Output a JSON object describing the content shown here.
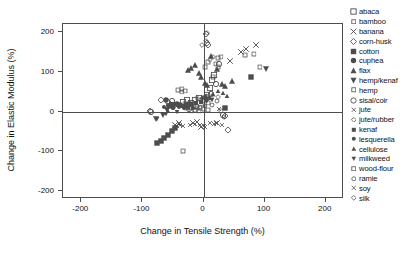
{
  "chart_data": {
    "type": "scatter",
    "title": "",
    "xlabel": "Change in Tensile Strength (%)",
    "ylabel": "Change in Elastic Modulus (%)",
    "xlim": [
      -230,
      230
    ],
    "ylim": [
      -220,
      220
    ],
    "xticks": [
      -200,
      -100,
      0,
      100,
      200
    ],
    "xticklabels": [
      "-200",
      "-100",
      "0",
      "100",
      "200"
    ],
    "yticks": [
      200,
      100,
      0,
      -100,
      -200
    ],
    "yticklabels": [
      "200",
      "100",
      "0",
      "-100",
      "-200"
    ],
    "grid": false,
    "reference_lines": {
      "x": 0,
      "y": 0
    },
    "legend_position": "right-outside",
    "series": [
      {
        "name": "abaca",
        "marker": "open-square",
        "points": [
          [
            -34,
            24
          ],
          [
            -27,
            30
          ],
          [
            -20,
            22
          ],
          [
            -14,
            28
          ],
          [
            -8,
            34
          ],
          [
            6,
            42
          ],
          [
            10,
            60
          ],
          [
            14,
            78
          ],
          [
            18,
            92
          ]
        ]
      },
      {
        "name": "bamboo",
        "marker": "open-square-small",
        "points": [
          [
            -42,
            54
          ],
          [
            -36,
            50
          ],
          [
            -30,
            20
          ],
          [
            -24,
            18
          ],
          [
            3,
            112
          ],
          [
            8,
            124
          ],
          [
            20,
            120
          ],
          [
            24,
            134
          ]
        ]
      },
      {
        "name": "banana",
        "marker": "cross-x",
        "points": [
          [
            -46,
            -34
          ],
          [
            -40,
            -30
          ],
          [
            -18,
            -28
          ],
          [
            -10,
            -26
          ],
          [
            -4,
            -38
          ],
          [
            22,
            -30
          ],
          [
            44,
            128
          ],
          [
            62,
            150
          ],
          [
            70,
            158
          ],
          [
            86,
            168
          ]
        ]
      },
      {
        "name": "corn-husk",
        "marker": "open-diamond",
        "points": [
          [
            -88,
            2
          ],
          [
            -70,
            28
          ],
          [
            -58,
            24
          ],
          [
            4,
            196
          ],
          [
            6,
            172
          ],
          [
            8,
            166
          ],
          [
            36,
            -12
          ],
          [
            40,
            -46
          ]
        ]
      },
      {
        "name": "cotton",
        "marker": "filled-square",
        "points": [
          [
            -76,
            -80
          ],
          [
            -70,
            -74
          ],
          [
            -64,
            -66
          ],
          [
            -58,
            -58
          ],
          [
            -52,
            -48
          ],
          [
            -46,
            -42
          ],
          [
            36,
            10
          ],
          [
            78,
            88
          ]
        ]
      },
      {
        "name": "cuphea",
        "marker": "filled-circle",
        "points": [
          [
            -62,
            30
          ],
          [
            -56,
            14
          ],
          [
            -50,
            12
          ],
          [
            -44,
            20
          ],
          [
            -38,
            16
          ],
          [
            -30,
            14
          ],
          [
            -22,
            18
          ]
        ]
      },
      {
        "name": "flax",
        "marker": "filled-triangle-up",
        "points": [
          [
            -26,
            104
          ],
          [
            -20,
            110
          ],
          [
            -14,
            116
          ],
          [
            -8,
            96
          ],
          [
            -4,
            88
          ],
          [
            2,
            72
          ],
          [
            6,
            66
          ],
          [
            12,
            140
          ],
          [
            22,
            108
          ],
          [
            30,
            70
          ],
          [
            36,
            64
          ],
          [
            46,
            76
          ]
        ]
      },
      {
        "name": "hemp/kenaf",
        "marker": "filled-triangle-down",
        "points": [
          [
            -78,
            -18
          ],
          [
            -66,
            -8
          ],
          [
            -60,
            4
          ],
          [
            102,
            106
          ]
        ]
      },
      {
        "name": "hemp",
        "marker": "open-square-small",
        "points": [
          [
            -36,
            56
          ],
          [
            -30,
            52
          ],
          [
            -16,
            12
          ],
          [
            -10,
            10
          ],
          [
            -6,
            8
          ],
          [
            2,
            18
          ],
          [
            8,
            22
          ],
          [
            16,
            86
          ],
          [
            24,
            112
          ],
          [
            28,
            138
          ]
        ]
      },
      {
        "name": "sisal/coir",
        "marker": "open-circle",
        "points": [
          [
            -86,
            0
          ],
          [
            -52,
            26
          ],
          [
            -24,
            6
          ],
          [
            -12,
            14
          ],
          [
            4,
            36
          ],
          [
            12,
            44
          ],
          [
            20,
            68
          ],
          [
            26,
            120
          ],
          [
            32,
            -10
          ]
        ]
      },
      {
        "name": "jute",
        "marker": "cross-x-small",
        "points": [
          [
            -44,
            -36
          ],
          [
            -38,
            -34
          ],
          [
            -14,
            -32
          ],
          [
            -6,
            -34
          ],
          [
            0,
            -36
          ],
          [
            10,
            -30
          ],
          [
            18,
            -32
          ],
          [
            30,
            -34
          ]
        ]
      },
      {
        "name": "jute/rubber",
        "marker": "open-diamond-small",
        "points": [
          [
            -2,
            166
          ],
          [
            4,
            178
          ],
          [
            6,
            198
          ],
          [
            10,
            130
          ],
          [
            16,
            136
          ]
        ]
      },
      {
        "name": "kenaf",
        "marker": "filled-square-small",
        "points": [
          [
            -54,
            20
          ],
          [
            -48,
            18
          ],
          [
            -42,
            16
          ],
          [
            -34,
            14
          ],
          [
            -28,
            16
          ],
          [
            -20,
            20
          ],
          [
            -12,
            22
          ],
          [
            -4,
            24
          ],
          [
            4,
            28
          ]
        ]
      },
      {
        "name": "lesquerella",
        "marker": "filled-circle-small",
        "points": [
          [
            -64,
            12
          ],
          [
            -58,
            16
          ],
          [
            -50,
            10
          ],
          [
            -40,
            12
          ],
          [
            -32,
            10
          ],
          [
            -26,
            8
          ],
          [
            -18,
            10
          ]
        ]
      },
      {
        "name": "cellulose",
        "marker": "filled-triangle-up-small",
        "points": [
          [
            -58,
            2
          ],
          [
            -2,
            36
          ],
          [
            4,
            40
          ],
          [
            10,
            34
          ],
          [
            16,
            44
          ],
          [
            24,
            52
          ],
          [
            32,
            46
          ],
          [
            38,
            40
          ]
        ]
      },
      {
        "name": "milkweed",
        "marker": "filled-triangle-down-small",
        "points": [
          [
            -76,
            -20
          ],
          [
            -62,
            -6
          ],
          [
            -44,
            0
          ],
          [
            -2,
            30
          ],
          [
            6,
            26
          ],
          [
            14,
            30
          ]
        ]
      },
      {
        "name": "wood-flour",
        "marker": "open-square-small",
        "points": [
          [
            -33,
            -100
          ],
          [
            -20,
            2
          ],
          [
            -14,
            4
          ],
          [
            -8,
            2
          ],
          [
            0,
            6
          ],
          [
            8,
            4
          ],
          [
            28,
            2
          ],
          [
            68,
            142
          ],
          [
            82,
            144
          ],
          [
            92,
            112
          ]
        ]
      },
      {
        "name": "ramie",
        "marker": "open-circle-small",
        "points": [
          [
            -30,
            8
          ],
          [
            -20,
            10
          ],
          [
            -6,
            12
          ],
          [
            2,
            14
          ],
          [
            14,
            16
          ],
          [
            22,
            26
          ],
          [
            34,
            -14
          ]
        ]
      },
      {
        "name": "soy",
        "marker": "cross-x-small",
        "points": [
          [
            -40,
            -32
          ],
          [
            -34,
            -36
          ],
          [
            -22,
            -34
          ],
          [
            2,
            -40
          ],
          [
            20,
            -30
          ],
          [
            26,
            6
          ]
        ]
      },
      {
        "name": "silk",
        "marker": "open-diamond-small",
        "points": [
          [
            -10,
            34
          ],
          [
            -4,
            30
          ],
          [
            6,
            32
          ],
          [
            14,
            38
          ],
          [
            24,
            36
          ]
        ]
      }
    ]
  },
  "axes": {
    "x_title": "Change in Tensile Strength (%)",
    "y_title": "Change in Elastic Modulus (%)",
    "x_ticklabels": [
      "-200",
      "-100",
      "0",
      "100",
      "200"
    ],
    "y_ticklabels": [
      "200",
      "100",
      "0",
      "-100",
      "-200"
    ]
  },
  "legend": {
    "items": [
      {
        "label": "abaca",
        "marker": "open-square"
      },
      {
        "label": "bamboo",
        "marker": "open-square-small"
      },
      {
        "label": "banana",
        "marker": "cross-x"
      },
      {
        "label": "corn-husk",
        "marker": "open-diamond"
      },
      {
        "label": "cotton",
        "marker": "filled-square"
      },
      {
        "label": "cuphea",
        "marker": "filled-circle"
      },
      {
        "label": "flax",
        "marker": "filled-triangle-up"
      },
      {
        "label": "hemp/kenaf",
        "marker": "filled-triangle-down"
      },
      {
        "label": "hemp",
        "marker": "open-square-small"
      },
      {
        "label": "sisal/coir",
        "marker": "open-circle"
      },
      {
        "label": "jute",
        "marker": "cross-x-small"
      },
      {
        "label": "jute/rubber",
        "marker": "open-diamond-small"
      },
      {
        "label": "kenaf",
        "marker": "filled-square-small"
      },
      {
        "label": "lesquerella",
        "marker": "filled-circle-small"
      },
      {
        "label": "cellulose",
        "marker": "filled-triangle-up-small"
      },
      {
        "label": "milkweed",
        "marker": "filled-triangle-down-small"
      },
      {
        "label": "wood-flour",
        "marker": "open-square-small"
      },
      {
        "label": "ramie",
        "marker": "open-circle-small"
      },
      {
        "label": "soy",
        "marker": "cross-x-small"
      },
      {
        "label": "silk",
        "marker": "open-diamond-small"
      }
    ]
  },
  "colors": {
    "marker": "#4d4d4d",
    "axis": "#4d4d4d",
    "text": "#111111",
    "background": "#ffffff"
  }
}
